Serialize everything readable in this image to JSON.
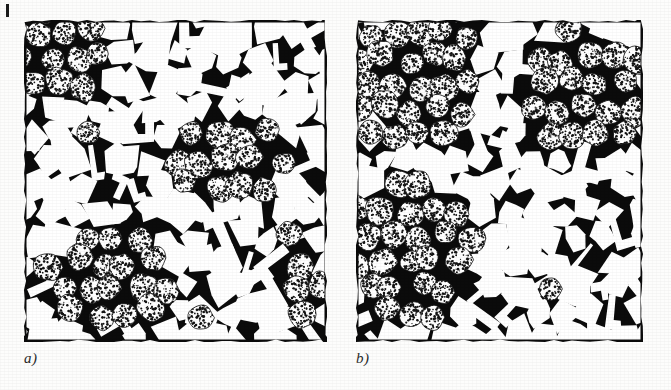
{
  "figure": {
    "kind": "two-panel-micrograph",
    "background_color": "#fdfdfc",
    "corner_tick_color": "#1b1b1b",
    "panels": [
      {
        "id": "a",
        "label": "a)",
        "matrix_color": "#0b0b0b",
        "grain_color": "#ffffff",
        "stipple_color": "#1a1a1a",
        "x": 24,
        "y": 20,
        "width": 303,
        "height": 322,
        "description": "Angular white grains in black matrix with clustered regions of stippled rounded grains",
        "stipple_clusters": [
          {
            "cx": 0.14,
            "cy": 0.12,
            "rx": 0.17,
            "ry": 0.16
          },
          {
            "cx": 0.68,
            "cy": 0.44,
            "rx": 0.22,
            "ry": 0.14
          },
          {
            "cx": 0.28,
            "cy": 0.8,
            "rx": 0.22,
            "ry": 0.16
          },
          {
            "cx": 0.92,
            "cy": 0.82,
            "rx": 0.1,
            "ry": 0.12
          }
        ]
      },
      {
        "id": "b",
        "label": "b)",
        "matrix_color": "#0b0b0b",
        "grain_color": "#ffffff",
        "stipple_color": "#1a1a1a",
        "x": 356,
        "y": 20,
        "width": 287,
        "height": 322,
        "description": "Angular white grains in black matrix with a large contiguous stippled rounded-grain band on the left and upper right",
        "stipple_clusters": [
          {
            "cx": 0.2,
            "cy": 0.18,
            "rx": 0.24,
            "ry": 0.2
          },
          {
            "cx": 0.8,
            "cy": 0.22,
            "rx": 0.22,
            "ry": 0.2
          },
          {
            "cx": 0.18,
            "cy": 0.72,
            "rx": 0.24,
            "ry": 0.22
          }
        ]
      }
    ]
  },
  "chart_data": {
    "type": "heatmap",
    "title": "",
    "xlabel": "",
    "ylabel": "",
    "legend": [],
    "annotations": [
      "a)",
      "b)"
    ],
    "series": [
      {
        "name": "panel-a-phase-fraction-white-grains",
        "values": [
          0.62
        ]
      },
      {
        "name": "panel-a-phase-fraction-stippled-grains",
        "values": [
          0.16
        ]
      },
      {
        "name": "panel-a-phase-fraction-matrix",
        "values": [
          0.22
        ]
      },
      {
        "name": "panel-b-phase-fraction-white-grains",
        "values": [
          0.55
        ]
      },
      {
        "name": "panel-b-phase-fraction-stippled-grains",
        "values": [
          0.26
        ]
      },
      {
        "name": "panel-b-phase-fraction-matrix",
        "values": [
          0.19
        ]
      }
    ]
  }
}
